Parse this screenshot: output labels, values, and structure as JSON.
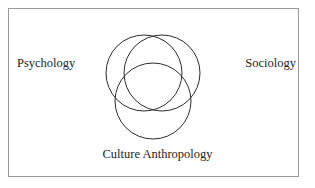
{
  "diagram": {
    "background_color": "#ffffff",
    "frame": {
      "name": "outer-border",
      "stroke_color": "#9a9a9a",
      "stroke_width": 1
    },
    "circles": [
      {
        "id": "psychology",
        "label": "Psychology",
        "cx": 144,
        "cy": 73,
        "r": 38,
        "stroke_color": "#2b2b2b",
        "stroke_width": 1,
        "fill": "none"
      },
      {
        "id": "sociology",
        "label": "Sociology",
        "cx": 162,
        "cy": 73,
        "r": 38,
        "stroke_color": "#2b2b2b",
        "stroke_width": 1,
        "fill": "none"
      },
      {
        "id": "culture-anthropology",
        "label": "Culture Anthropology",
        "cx": 153,
        "cy": 101,
        "r": 38,
        "stroke_color": "#2b2b2b",
        "stroke_width": 1,
        "fill": "none"
      }
    ],
    "labels": {
      "left": "Psychology",
      "right": "Sociology",
      "bottom": "Culture Anthropology"
    }
  }
}
